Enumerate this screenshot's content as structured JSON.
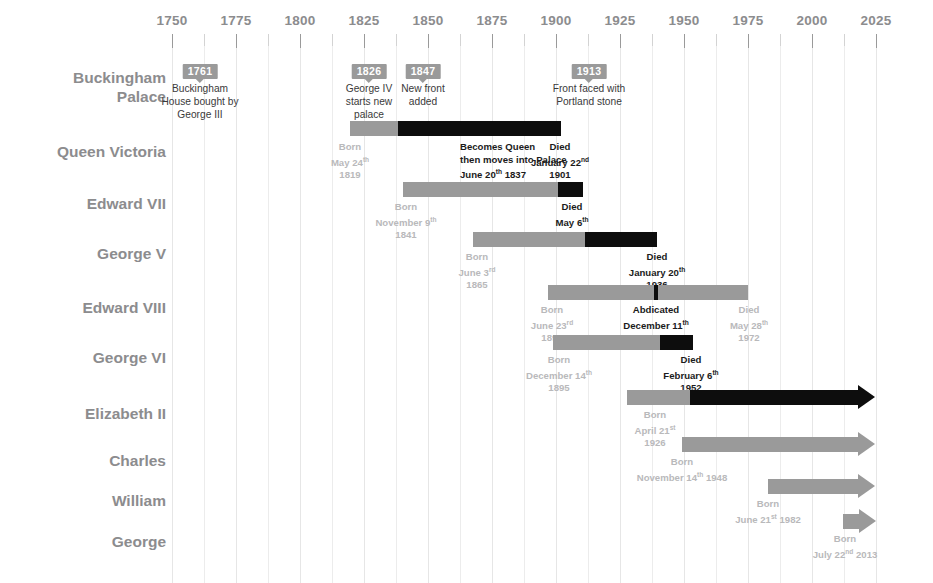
{
  "axis": {
    "label_years": [
      1750,
      1775,
      1800,
      1825,
      1850,
      1875,
      1900,
      1925,
      1950,
      1975,
      2000,
      2025
    ],
    "minor_years": [
      1762,
      1787,
      1812,
      1837,
      1862,
      1887,
      1912,
      1937,
      1962,
      1987,
      2012
    ],
    "range": [
      1745,
      2028
    ],
    "colors": {
      "grid": "#ececec",
      "tick": "#9a9a9a",
      "label": "#8c8c8e",
      "bar_grey": "#9a9a9a",
      "bar_black": "#0d0d0d",
      "anno_light": "#b9b9bb",
      "anno_dark": "#1b1b1b",
      "badge_bg": "#9a9a9a"
    }
  },
  "rows": [
    {
      "id": "buckingham-palace",
      "label": "Buckingham\nPalace"
    },
    {
      "id": "queen-victoria",
      "label": "Queen Victoria"
    },
    {
      "id": "edward-vii",
      "label": "Edward VII"
    },
    {
      "id": "george-v",
      "label": "George V"
    },
    {
      "id": "edward-viii",
      "label": "Edward VIII"
    },
    {
      "id": "george-vi",
      "label": "George VI"
    },
    {
      "id": "elizabeth-ii",
      "label": "Elizabeth II"
    },
    {
      "id": "charles",
      "label": "Charles"
    },
    {
      "id": "william",
      "label": "William"
    },
    {
      "id": "george",
      "label": "George"
    }
  ],
  "palace_events": [
    {
      "year": "1761",
      "text": "Buckingham\nHouse bought by\nGeorge III"
    },
    {
      "year": "1826",
      "text": "George IV\nstarts new\npalace"
    },
    {
      "year": "1847",
      "text": "New front\nadded"
    },
    {
      "year": "1913",
      "text": "Front faced with\nPortland stone"
    }
  ],
  "annotations": {
    "victoria_born": "Born\nMay 24th\n1819",
    "victoria_queen": "Becomes Queen\nthen moves into Palace\nJune 20th 1837",
    "victoria_died": "Died\nJanuary 22nd\n1901",
    "edward7_born": "Born\nNovember 9th\n1841",
    "edward7_died": "Died\nMay 6th\n1910",
    "george5_born": "Born\nJune 3rd\n1865",
    "george5_died": "Died\nJanuary 20th\n1936",
    "edward8_born": "Born\nJune 23rd\n1894",
    "edward8_abdicated": "Abdicated\nDecember 11th\n1936",
    "edward8_died": "Died\nMay 28th\n1972",
    "george6_born": "Born\nDecember 14th\n1895",
    "george6_died": "Died\nFebruary 6th\n1952",
    "elizabeth2_born": "Born\nApril 21st\n1926",
    "charles_born": "Born\nNovember 14th 1948",
    "william_born": "Born\nJune 21st 1982",
    "george_born": "Born\nJuly 22nd 2013"
  },
  "chart_data": {
    "type": "bar",
    "xlabel": "",
    "ylabel": "",
    "xlim": [
      1745,
      2028
    ],
    "grid": true,
    "legend": "none",
    "categories": [
      "Buckingham Palace",
      "Queen Victoria",
      "Edward VII",
      "George V",
      "Edward VIII",
      "George VI",
      "Elizabeth II",
      "Charles",
      "William",
      "George"
    ],
    "series": [
      {
        "name": "Life before reign (grey)",
        "segments": [
          {
            "category": "Queen Victoria",
            "start": 1819,
            "end": 1837
          },
          {
            "category": "Edward VII",
            "start": 1841,
            "end": 1901
          },
          {
            "category": "George V",
            "start": 1865,
            "end": 1910
          },
          {
            "category": "Edward VIII",
            "start": 1894,
            "end": 1936
          },
          {
            "category": "George VI",
            "start": 1895,
            "end": 1936
          },
          {
            "category": "Elizabeth II",
            "start": 1926,
            "end": 1952
          },
          {
            "category": "Charles",
            "start": 1948,
            "end": 2025
          },
          {
            "category": "William",
            "start": 1982,
            "end": 2025
          },
          {
            "category": "George",
            "start": 2013,
            "end": 2025
          }
        ]
      },
      {
        "name": "Reign (black)",
        "segments": [
          {
            "category": "Queen Victoria",
            "start": 1837,
            "end": 1901
          },
          {
            "category": "Edward VII",
            "start": 1901,
            "end": 1910
          },
          {
            "category": "George V",
            "start": 1910,
            "end": 1936
          },
          {
            "category": "Edward VIII",
            "start": 1936,
            "end": 1936
          },
          {
            "category": "George VI",
            "start": 1936,
            "end": 1952
          },
          {
            "category": "Elizabeth II",
            "start": 1952,
            "end": 2025
          }
        ]
      },
      {
        "name": "Life after abdication (grey)",
        "segments": [
          {
            "category": "Edward VIII",
            "start": 1936,
            "end": 1972
          }
        ]
      }
    ],
    "events": [
      {
        "category": "Buckingham Palace",
        "year": 1761,
        "label": "Buckingham House bought by George III"
      },
      {
        "category": "Buckingham Palace",
        "year": 1826,
        "label": "George IV starts new palace"
      },
      {
        "category": "Buckingham Palace",
        "year": 1847,
        "label": "New front added"
      },
      {
        "category": "Buckingham Palace",
        "year": 1913,
        "label": "Front faced with Portland stone"
      }
    ],
    "tick_labels": [
      "1750",
      "1775",
      "1800",
      "1825",
      "1850",
      "1875",
      "1900",
      "1925",
      "1950",
      "1975",
      "2000",
      "2025"
    ]
  }
}
